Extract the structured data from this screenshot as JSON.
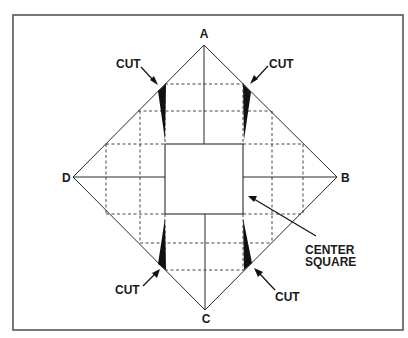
{
  "diagram": {
    "title": "",
    "vertices": {
      "A": {
        "label": "A"
      },
      "B": {
        "label": "B"
      },
      "C": {
        "label": "C"
      },
      "D": {
        "label": "D"
      }
    },
    "callouts": {
      "cut_top_left": "CUT",
      "cut_top_right": "CUT",
      "cut_bottom_left": "CUT",
      "cut_bottom_right": "CUT",
      "center_square_line1": "CENTER",
      "center_square_line2": "SQUARE"
    },
    "colors": {
      "line": "#2a2a2a",
      "wedge": "#111111",
      "border": "#555555",
      "background": "#ffffff"
    }
  }
}
